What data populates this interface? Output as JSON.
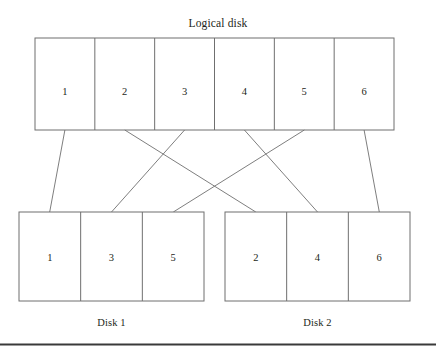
{
  "figure": {
    "title": "Logical disk",
    "bottom_rule": true
  },
  "logical_disk": {
    "label": "Logical disk",
    "blocks": [
      {
        "id": "1",
        "index": 0
      },
      {
        "id": "2",
        "index": 1
      },
      {
        "id": "3",
        "index": 2
      },
      {
        "id": "4",
        "index": 3
      },
      {
        "id": "5",
        "index": 4
      },
      {
        "id": "6",
        "index": 5
      }
    ]
  },
  "disks": [
    {
      "label": "Disk 1",
      "blocks": [
        {
          "id": "1"
        },
        {
          "id": "3"
        },
        {
          "id": "5"
        }
      ]
    },
    {
      "label": "Disk 2",
      "blocks": [
        {
          "id": "2"
        },
        {
          "id": "4"
        },
        {
          "id": "6"
        }
      ]
    }
  ],
  "mappings": [
    {
      "from": "1",
      "to_disk": "Disk 1",
      "to_slot": 0
    },
    {
      "from": "2",
      "to_disk": "Disk 2",
      "to_slot": 0
    },
    {
      "from": "3",
      "to_disk": "Disk 1",
      "to_slot": 1
    },
    {
      "from": "4",
      "to_disk": "Disk 2",
      "to_slot": 1
    },
    {
      "from": "5",
      "to_disk": "Disk 1",
      "to_slot": 2
    },
    {
      "from": "6",
      "to_disk": "Disk 2",
      "to_slot": 2
    }
  ],
  "colors": {
    "stroke": "#6f6f6f",
    "text": "#231f20",
    "rule": "#3a3a3a",
    "background": "#ffffff"
  }
}
